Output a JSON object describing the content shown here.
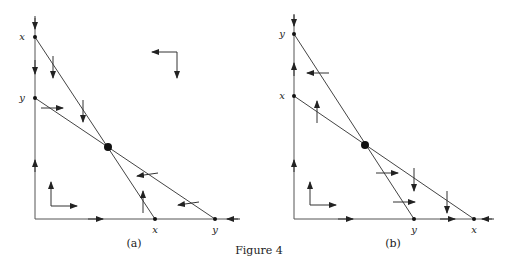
{
  "figure": {
    "caption": "Figure 4",
    "panels": [
      {
        "id": "a",
        "caption": "(a)",
        "vertical_axis_labels": {
          "top": "x",
          "lower": "y"
        },
        "horizontal_axis_labels": {
          "near": "x",
          "far": "y"
        }
      },
      {
        "id": "b",
        "caption": "(b)",
        "vertical_axis_labels": {
          "top": "y",
          "lower": "x"
        },
        "horizontal_axis_labels": {
          "near": "y",
          "far": "x"
        }
      }
    ]
  }
}
